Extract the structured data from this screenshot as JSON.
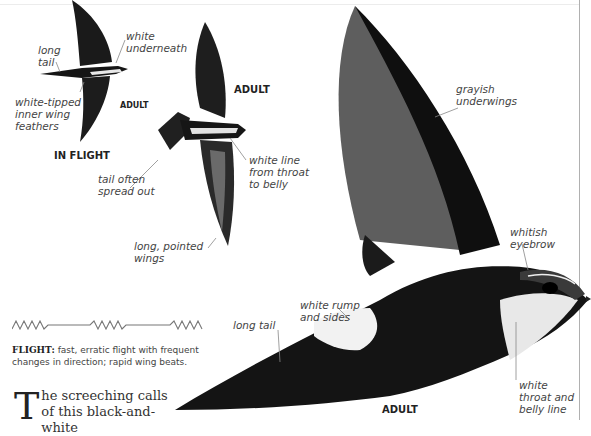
{
  "labels": {
    "long_tail_small": "long\ntail",
    "white_underneath": "white\nunderneath",
    "white_tipped": "white-tipped\ninner wing\nfeathers",
    "adult_small": "ADULT",
    "in_flight": "IN FLIGHT",
    "adult_middle": "ADULT",
    "white_line": "white line\nfrom throat\nto belly",
    "tail_spread": "tail often\nspread out",
    "long_pointed": "long, pointed\nwings",
    "grayish_underwings": "grayish\nunderwings",
    "whitish_eyebrow": "whitish\neyebrow",
    "white_rump": "white rump\nand sides",
    "long_tail_large": "long tail",
    "white_throat": "white\nthroat and\nbelly line",
    "adult_large": "ADULT"
  },
  "flight": {
    "heading": "FLIGHT:",
    "description": " fast, erratic flight with frequent changes in direction; rapid wing beats."
  },
  "body": {
    "dropcap": "T",
    "text": "he screeching calls of this black-and-white"
  },
  "colors": {
    "bird_dark": "#111111",
    "bird_gray": "#6a6a6a",
    "rule": "#b0b0b0"
  }
}
